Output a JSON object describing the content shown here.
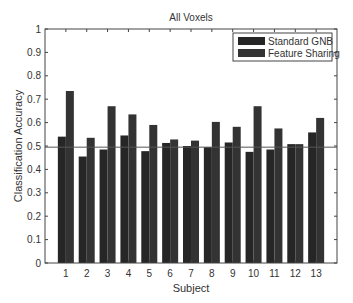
{
  "chart_data": {
    "type": "bar",
    "title": "All Voxels",
    "xlabel": "Subject",
    "ylabel": "Classification Accuracy",
    "categories": [
      "1",
      "2",
      "3",
      "4",
      "5",
      "6",
      "7",
      "8",
      "9",
      "10",
      "11",
      "12",
      "13"
    ],
    "series": [
      {
        "name": "Standard GNB",
        "color": "#262626",
        "values": [
          0.54,
          0.455,
          0.485,
          0.545,
          0.478,
          0.513,
          0.5,
          0.495,
          0.515,
          0.475,
          0.485,
          0.508,
          0.558
        ]
      },
      {
        "name": "Feature Sharing",
        "color": "#333333",
        "values": [
          0.735,
          0.535,
          0.67,
          0.635,
          0.59,
          0.528,
          0.523,
          0.603,
          0.582,
          0.67,
          0.575,
          0.508,
          0.62
        ]
      }
    ],
    "reference_line": 0.495,
    "ylim": [
      0,
      1
    ],
    "xlim": [
      0,
      14
    ],
    "yticks": [
      "0",
      "0.1",
      "0.2",
      "0.3",
      "0.4",
      "0.5",
      "0.6",
      "0.7",
      "0.8",
      "0.9",
      "1"
    ],
    "grid": false,
    "legend_position": "upper right"
  }
}
